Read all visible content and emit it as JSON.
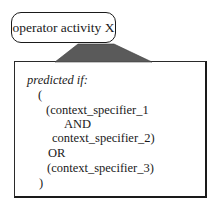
{
  "operator": {
    "label": "operator activity X"
  },
  "condition": {
    "heading": "predicted if:",
    "lines": [
      "(",
      "(context_specifier_1",
      "AND",
      "context_specifier_2)",
      "OR",
      "(context_specifier_3)",
      ")"
    ]
  },
  "colors": {
    "connector_fill": "#5a5a5a",
    "stroke": "#1a1a1a"
  }
}
